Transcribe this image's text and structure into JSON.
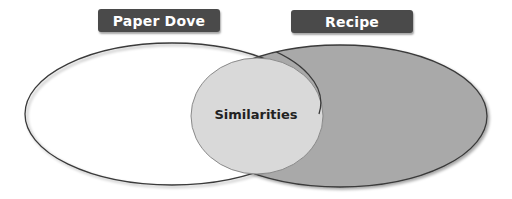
{
  "diagram": {
    "type": "venn",
    "sets": [
      {
        "label": "Paper Dove",
        "fill": "#ffffff",
        "stroke": "#333333"
      },
      {
        "label": "Recipe",
        "fill": "#a9a9a9",
        "stroke": "#333333"
      }
    ],
    "intersection": {
      "label": "Similarities",
      "fill": "#d9d9d9"
    },
    "label_box_color": "#4a4a4a",
    "label_text_color": "#ffffff"
  }
}
